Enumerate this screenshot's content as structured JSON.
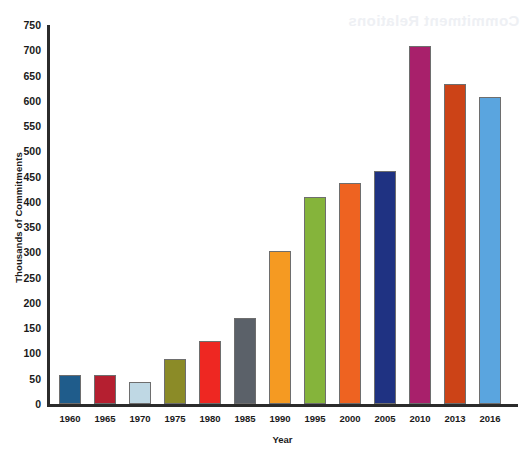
{
  "artifact": {
    "bleed_text": "Commitment Relations"
  },
  "chart_data": {
    "type": "bar",
    "title": "",
    "xlabel": "Year",
    "ylabel": "Thousands of Commitments",
    "categories": [
      "1960",
      "1965",
      "1970",
      "1975",
      "1980",
      "1985",
      "1990",
      "1995",
      "2000",
      "2005",
      "2010",
      "2013",
      "2016"
    ],
    "values": [
      57,
      57,
      44,
      89,
      124,
      170,
      302,
      409,
      437,
      461,
      708,
      633,
      608
    ],
    "bar_colors": [
      "#1F5C8B",
      "#B51F30",
      "#BFD8E4",
      "#8B8B27",
      "#EE2722",
      "#5B6169",
      "#F59A22",
      "#85B43B",
      "#EE6321",
      "#1F3282",
      "#A8206B",
      "#CC4317",
      "#5AA5DF"
    ],
    "ylim": [
      0,
      750
    ],
    "yticks": [
      750,
      700,
      650,
      600,
      550,
      500,
      450,
      400,
      350,
      300,
      250,
      200,
      150,
      100,
      50,
      0
    ],
    "grid": false,
    "legend": "none"
  }
}
